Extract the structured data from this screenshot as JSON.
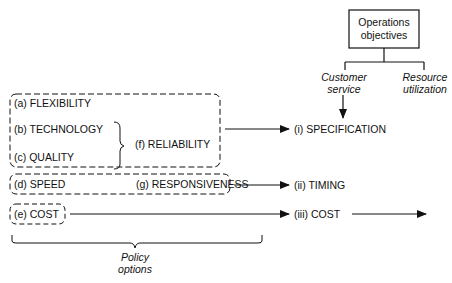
{
  "top": {
    "box_label_line1": "Operations",
    "box_label_line2": "objectives",
    "branch_left_line1": "Customer",
    "branch_left_line2": "service",
    "branch_right_line1": "Resource",
    "branch_right_line2": "utilization"
  },
  "policy": {
    "a": "(a) FLEXIBILITY",
    "b": "(b) TECHNOLOGY",
    "c": "(c) QUALITY",
    "f": "(f) RELIABILITY",
    "d": "(d) SPEED",
    "g": "(g) RESPONSIVENESS",
    "e": "(e) COST",
    "brace_label_line1": "Policy",
    "brace_label_line2": "options"
  },
  "outcomes": {
    "i": "(i) SPECIFICATION",
    "ii": "(ii) TIMING",
    "iii": "(iii) COST"
  }
}
